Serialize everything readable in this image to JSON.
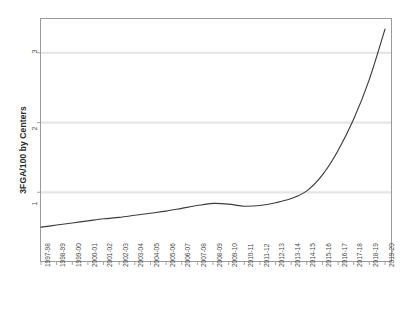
{
  "chart_data": {
    "type": "line",
    "title": "",
    "xlabel": "",
    "ylabel": "3FGA/100 by Centers",
    "ylim": [
      0,
      3.5
    ],
    "yticks": [
      1,
      2,
      3
    ],
    "ytick_labels": [
      "1",
      "2",
      "3"
    ],
    "grid": true,
    "legend": false,
    "legend_position": "none",
    "categories": [
      "1997-98",
      "1998-99",
      "1999-00",
      "2000-01",
      "2001-02",
      "2002-03",
      "2003-04",
      "2004-05",
      "2005-06",
      "2006-07",
      "2007-08",
      "2008-09",
      "2009-10",
      "2010-11",
      "2011-12",
      "2012-13",
      "2013-14",
      "2014-15",
      "2015-16",
      "2016-17",
      "2017-18",
      "2018-19",
      "2019-20"
    ],
    "series": [
      {
        "name": "3FGA/100 by Centers",
        "color": "#3c3c3c",
        "values": [
          0.5,
          0.53,
          0.56,
          0.59,
          0.62,
          0.64,
          0.67,
          0.7,
          0.73,
          0.77,
          0.81,
          0.84,
          0.83,
          0.8,
          0.81,
          0.85,
          0.91,
          1.02,
          1.25,
          1.6,
          2.05,
          2.62,
          3.34
        ]
      }
    ]
  },
  "axes": {
    "y_title": "3FGA/100 by Centers",
    "y_tick_1": "1",
    "y_tick_2": "2",
    "y_tick_3": "3"
  }
}
